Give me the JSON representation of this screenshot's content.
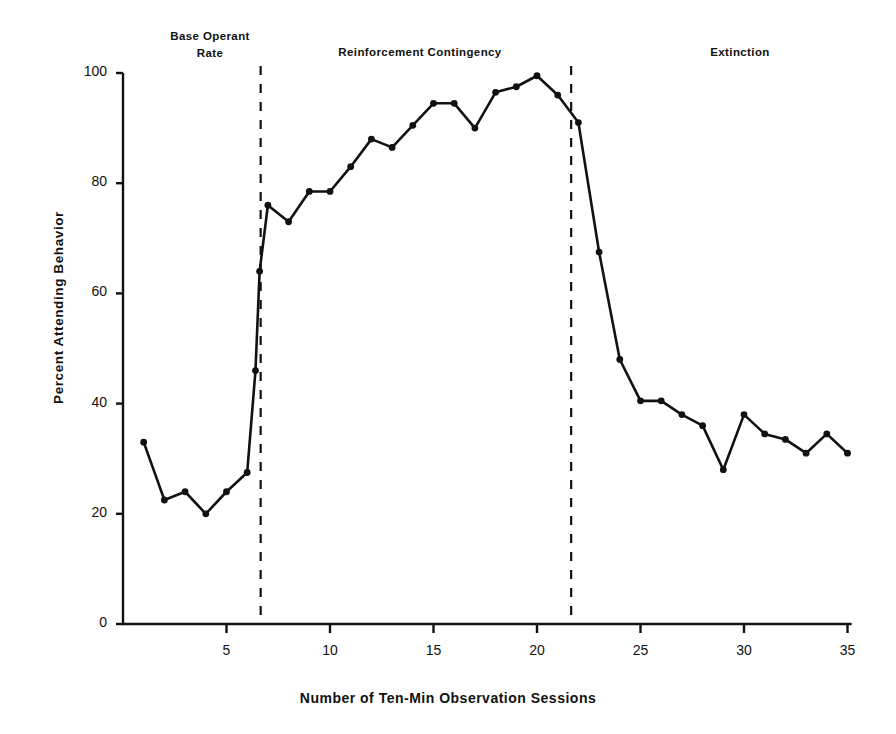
{
  "chart_data": {
    "type": "line",
    "title": "",
    "xlabel": "Number of Ten-Min Observation Sessions",
    "ylabel": "Percent Attending Behavior",
    "xlim": [
      0,
      36
    ],
    "ylim": [
      0,
      100
    ],
    "grid": false,
    "legend": "none",
    "xticks": [
      5,
      10,
      15,
      20,
      25,
      30,
      35
    ],
    "yticks": [
      0,
      20,
      40,
      60,
      80,
      100
    ],
    "series": [
      {
        "name": "Percent Attending Behavior",
        "marker": "filled-circle",
        "color": "#111111",
        "x": [
          1,
          2,
          3,
          4,
          5,
          6,
          6.4,
          6.6,
          7,
          8,
          9,
          10,
          11,
          12,
          13,
          14,
          15,
          16,
          17,
          18,
          19,
          20,
          21,
          22,
          23,
          24,
          25,
          26,
          27,
          28,
          29,
          30,
          31,
          32,
          33,
          34,
          35
        ],
        "values": [
          33,
          22.5,
          24,
          20,
          24,
          27.5,
          46,
          64,
          76,
          73,
          78.5,
          78.5,
          83,
          88,
          86.5,
          90.5,
          94.5,
          94.5,
          90,
          96.5,
          97.5,
          99.5,
          96,
          91,
          67.5,
          48,
          40.5,
          40.5,
          38,
          36,
          28,
          38,
          34.5,
          33.5,
          31,
          34.5,
          31
        ]
      }
    ],
    "phases": [
      {
        "label": "Base Operant\nRate",
        "start": 1,
        "end": 6.65
      },
      {
        "label": "Reinforcement Contingency",
        "start": 6.65,
        "end": 21.65
      },
      {
        "label": "Extinction",
        "start": 21.65,
        "end": 35
      }
    ],
    "phase_lines": [
      6.65,
      21.65
    ],
    "phase_line_style": "dashed"
  }
}
